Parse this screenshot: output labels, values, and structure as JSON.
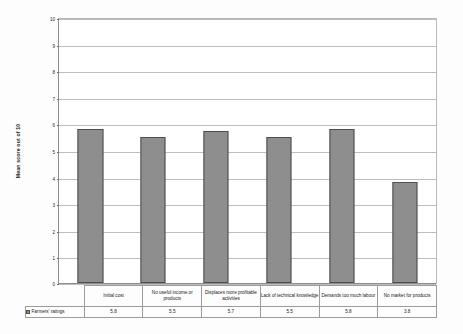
{
  "chart_data": {
    "type": "bar",
    "title": "",
    "xlabel": "",
    "ylabel": "Mean score out of 10",
    "ylim": [
      0,
      10
    ],
    "ytick_labels": [
      "10",
      "9",
      "8",
      "7",
      "6",
      "5",
      "4",
      "3",
      "2",
      "1",
      "0"
    ],
    "grid": true,
    "legend_position": "bottom-left-table",
    "categories": [
      "Initial cost",
      "No useful income or products",
      "Displaces more profitable activities",
      "Lack of technical knowledge",
      "Demands too much labour",
      "No market for products"
    ],
    "series": [
      {
        "name": "Farmers' ratings",
        "values": [
          5.8,
          5.5,
          5.7,
          5.5,
          5.8,
          3.8
        ],
        "value_labels": [
          "5.8",
          "5.5",
          "5.7",
          "5.5",
          "5.8",
          "3.8"
        ],
        "color": "#8e8e8e",
        "edge_color": "#4e4e4e"
      }
    ]
  },
  "table": {
    "series_label": "Farmers' ratings"
  }
}
